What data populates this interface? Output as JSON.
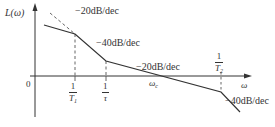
{
  "diagram": {
    "type": "bode-magnitude-asymptote",
    "y_axis_label": "L(ω)",
    "x_axis_label": "ω",
    "origin_label": "0",
    "slopes": [
      {
        "label": "−20dB/dec",
        "segment": "low-frequency"
      },
      {
        "label": "−40dB/dec",
        "segment": "between 1/T1 and 1/τ"
      },
      {
        "label": "−20dB/dec",
        "segment": "between 1/τ and 1/T2"
      },
      {
        "label": "−40dB/dec",
        "segment": "above 1/T2"
      }
    ],
    "break_frequencies": [
      {
        "numerator": "1",
        "denominator": "T",
        "sub": "1"
      },
      {
        "numerator": "1",
        "denominator": "τ",
        "sub": ""
      },
      {
        "numerator": "1",
        "denominator": "T",
        "sub": "2"
      }
    ],
    "crossover_label": "ω",
    "crossover_sub": "c",
    "colors": {
      "line": "#333333",
      "dashed": "#555555",
      "background": "#ffffff"
    }
  }
}
